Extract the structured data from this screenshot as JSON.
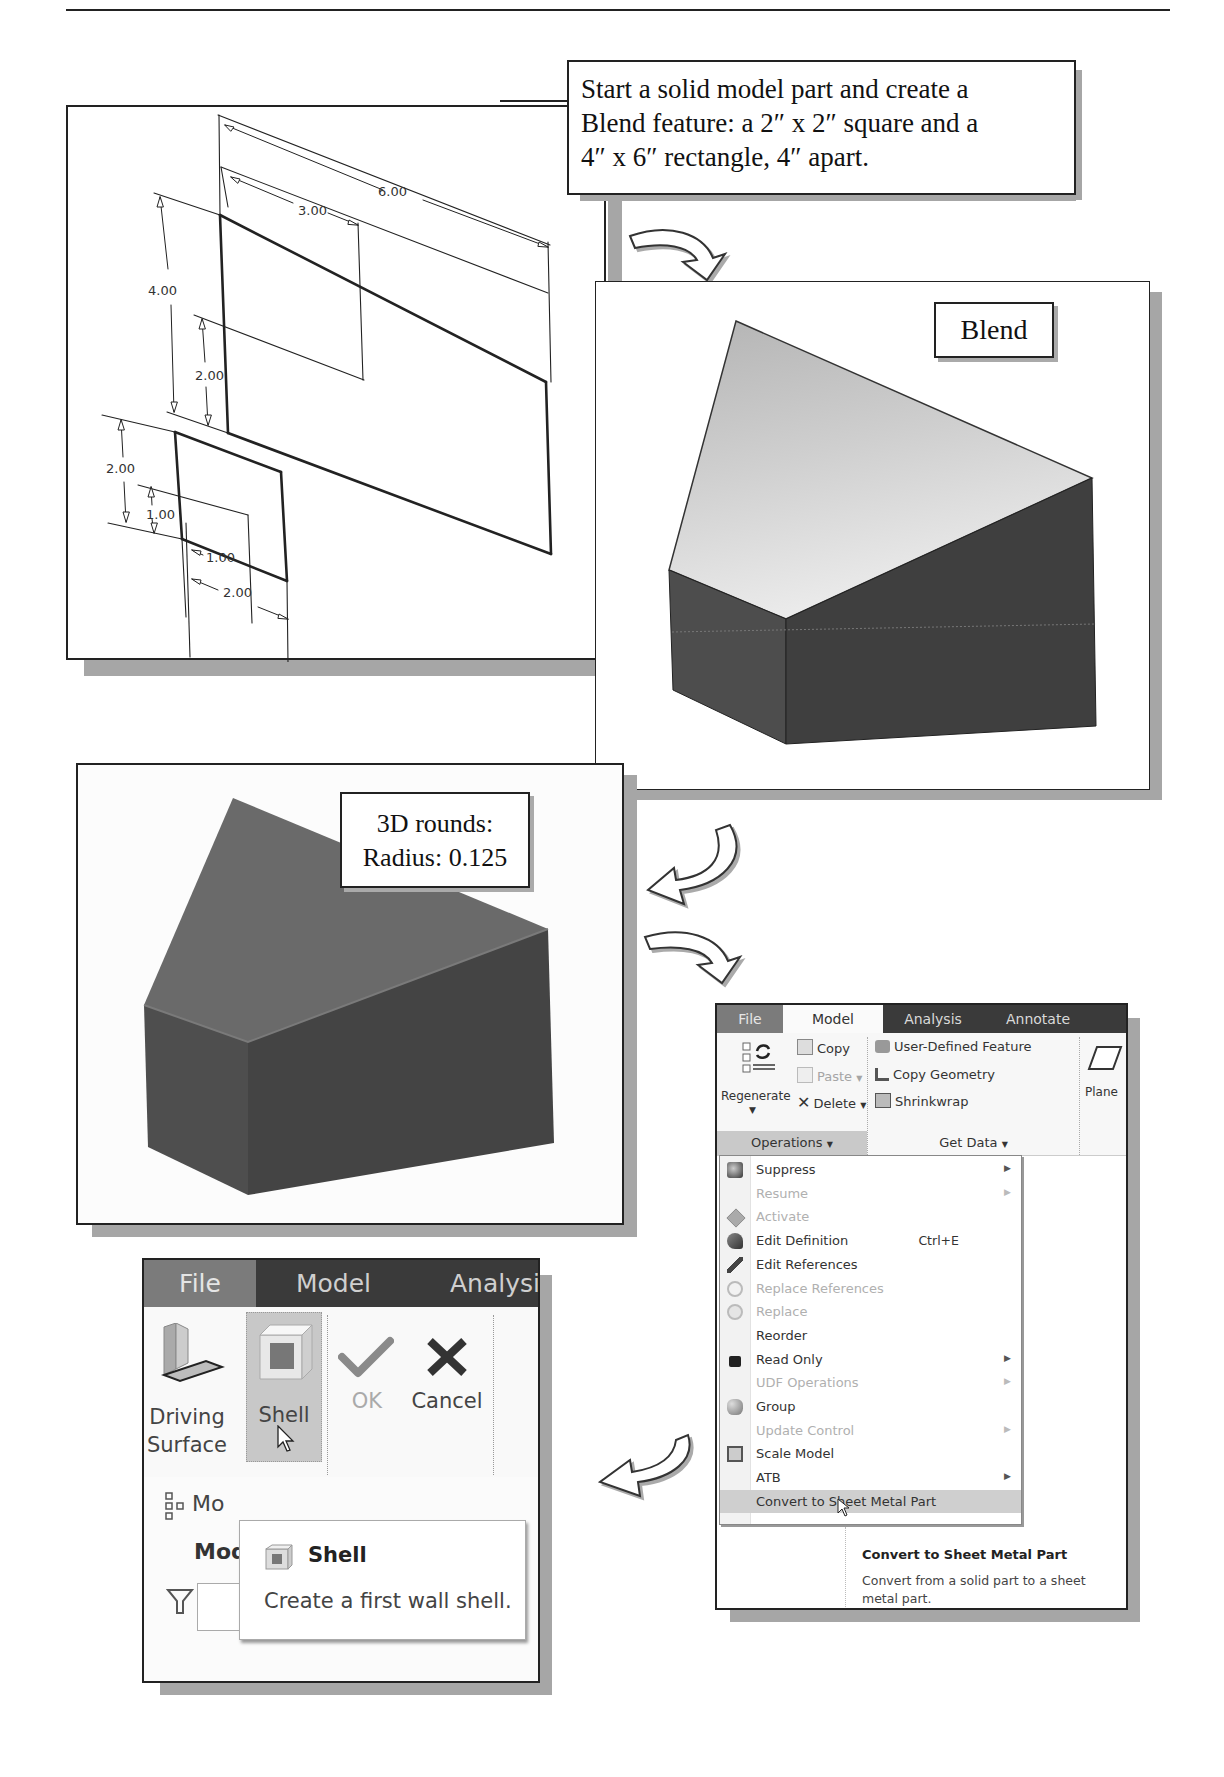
{
  "step1": {
    "callout_lines": [
      "Start a solid model part and create a",
      "Blend feature: a 2″ x 2″ square and a",
      "4″ x 6″ rectangle, 4″ apart."
    ],
    "dimensions": {
      "big_width_outer": "6.00",
      "big_width_inner": "3.00",
      "big_height_outer": "4.00",
      "big_height_inner": "2.00",
      "small_height_outer": "2.00",
      "small_height_inner": "1.00",
      "small_width_inner": "1.00",
      "small_width_outer": "2.00"
    }
  },
  "step2": {
    "label": "Blend"
  },
  "step3": {
    "label_lines": [
      "3D rounds:",
      "Radius: 0.125"
    ]
  },
  "ribbon": {
    "tabs": [
      "File",
      "Model",
      "Analysis",
      "Annotate"
    ],
    "active_tab": "Model",
    "operations": {
      "regenerate": "Regenerate",
      "copy": "Copy",
      "paste": "Paste",
      "delete": "Delete",
      "group_label": "Operations"
    },
    "get_data": {
      "items": [
        "User-Defined Feature",
        "Copy Geometry",
        "Shrinkwrap"
      ],
      "group_label": "Get Data"
    },
    "datum": {
      "plane": "Plane"
    },
    "menu": [
      {
        "label": "Suppress",
        "enabled": true,
        "submenu": true,
        "icon": "suppress-icon"
      },
      {
        "label": "Resume",
        "enabled": false,
        "submenu": true,
        "icon": ""
      },
      {
        "label": "Activate",
        "enabled": false,
        "submenu": false,
        "icon": "activate-icon"
      },
      {
        "label": "Edit Definition",
        "enabled": true,
        "submenu": false,
        "shortcut": "Ctrl+E",
        "icon": "edit-definition-icon"
      },
      {
        "label": "Edit References",
        "enabled": true,
        "submenu": false,
        "icon": "edit-references-icon"
      },
      {
        "label": "Replace References",
        "enabled": false,
        "submenu": false,
        "icon": "replace-references-icon"
      },
      {
        "label": "Replace",
        "enabled": false,
        "submenu": false,
        "icon": "replace-icon"
      },
      {
        "label": "Reorder",
        "enabled": true,
        "submenu": false,
        "icon": ""
      },
      {
        "label": "Read Only",
        "enabled": true,
        "submenu": true,
        "icon": "lock-icon"
      },
      {
        "label": "UDF Operations",
        "enabled": false,
        "submenu": true,
        "icon": ""
      },
      {
        "label": "Group",
        "enabled": true,
        "submenu": false,
        "icon": "group-icon"
      },
      {
        "label": "Update Control",
        "enabled": false,
        "submenu": true,
        "icon": ""
      },
      {
        "label": "Scale Model",
        "enabled": true,
        "submenu": false,
        "icon": "scale-model-icon"
      },
      {
        "label": "ATB",
        "enabled": true,
        "submenu": true,
        "icon": ""
      },
      {
        "label": "Convert to Sheet Metal Part",
        "enabled": true,
        "submenu": false,
        "highlighted": true,
        "icon": ""
      }
    ],
    "tooltip": {
      "title": "Convert to Sheet Metal Part",
      "description": "Convert from a solid part to a sheet metal part."
    }
  },
  "shell_ribbon": {
    "tabs": [
      "File",
      "Model",
      "Analysi"
    ],
    "buttons": {
      "driving_surface": [
        "Driving",
        "Surface"
      ],
      "shell": "Shell",
      "ok": "OK",
      "cancel": "Cancel"
    },
    "groups": [
      "First Wall",
      "Close"
    ],
    "model_tree_label": "Mo",
    "model_tree_header": "Mod",
    "tooltip": {
      "title": "Shell",
      "description": "Create a first wall shell."
    }
  }
}
